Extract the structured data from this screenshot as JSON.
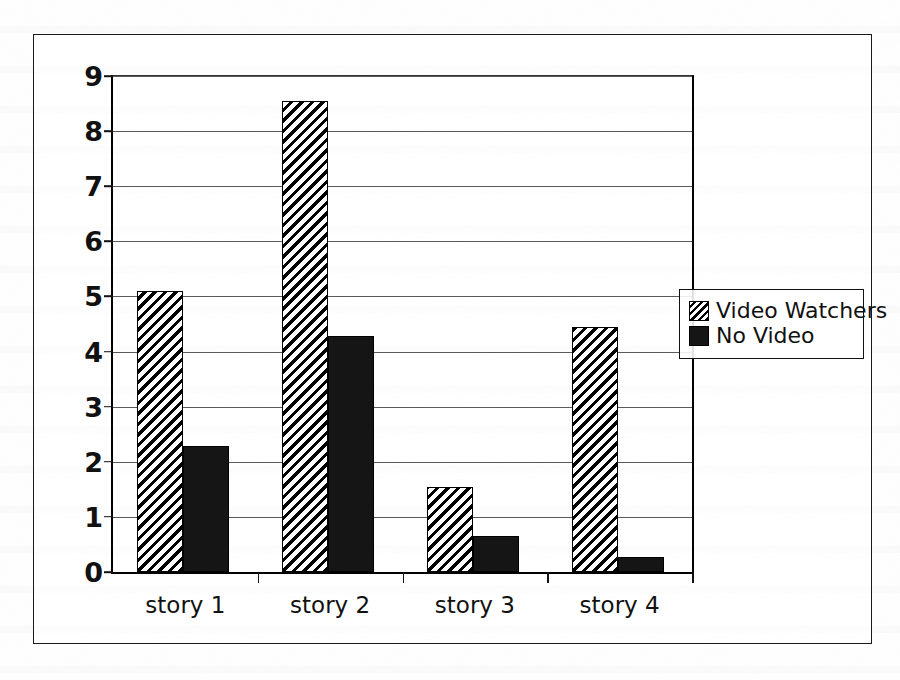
{
  "chart_data": {
    "type": "bar",
    "title": "",
    "subtitle": "",
    "xlabel": "",
    "ylabel": "",
    "categories": [
      "story 1",
      "story 2",
      "story 3",
      "story 4"
    ],
    "series": [
      {
        "name": "Video Watchers",
        "pattern": "diagonal-hatch",
        "values": [
          5.1,
          8.54,
          1.55,
          4.45
        ]
      },
      {
        "name": "No Video",
        "pattern": "solid-black",
        "values": [
          2.28,
          4.28,
          0.66,
          0.28
        ]
      }
    ],
    "ylim": [
      0,
      9
    ],
    "y_ticks": [
      "0",
      "1",
      "2",
      "3",
      "4",
      "5",
      "6",
      "7",
      "8",
      "9"
    ],
    "grid": true,
    "legend_position": "right-outside"
  },
  "legend": {
    "items": [
      {
        "label": "Video Watchers",
        "swatch": "hatched-swatch"
      },
      {
        "label": "No Video",
        "swatch": "solid-swatch"
      }
    ]
  },
  "colors": {
    "axis": "#111111",
    "gridline": "#5a5a5a",
    "bar_solid": "#151515",
    "bar_hatch_line": "#000000",
    "background": "#ffffff"
  }
}
